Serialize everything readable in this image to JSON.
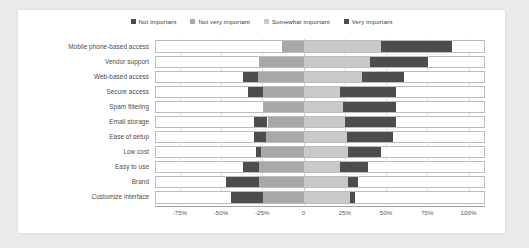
{
  "chart_data": {
    "type": "bar",
    "subtype": "diverging-stacked-likert",
    "title": "",
    "xlabel": "",
    "ylabel": "",
    "orientation": "horizontal",
    "grid": true,
    "legend_position": "top-center",
    "xlim": [
      -90,
      110
    ],
    "xticks": [
      -75,
      -50,
      -25,
      0,
      25,
      50,
      75,
      100
    ],
    "xticklabels": [
      "-75%",
      "-50%",
      "-25%",
      "0",
      "25%",
      "50%",
      "75%",
      "100%"
    ],
    "zero_reference": "boundary between 'Not very important' and 'Somewhat important'",
    "series": [
      {
        "name": "Not important",
        "color": "#4d4d4d",
        "values": [
          0,
          0,
          9,
          9,
          0,
          8,
          7,
          3,
          10,
          20,
          19
        ]
      },
      {
        "name": "Not very important",
        "color": "#a8a8a8",
        "values": [
          13,
          27,
          28,
          25,
          25,
          22,
          23,
          26,
          27,
          27,
          25
        ]
      },
      {
        "name": "Somewhat important",
        "color": "#c9c9c9",
        "values": [
          47,
          40,
          35,
          22,
          24,
          25,
          26,
          27,
          22,
          27,
          28
        ]
      },
      {
        "name": "Very important",
        "color": "#4d4d4d",
        "values": [
          43,
          35,
          26,
          34,
          32,
          31,
          28,
          20,
          17,
          6,
          3
        ]
      }
    ],
    "categories": [
      "Mobile phone-based access",
      "Vendor support",
      "Web-based access",
      "Secure access",
      "Spam filtering",
      "Email storage",
      "Ease of setup",
      "Low cost",
      "Easy to use",
      "Brand",
      "Customize interface"
    ]
  },
  "legend": {
    "items": [
      {
        "label": "Not important",
        "color": "#4d4d4d"
      },
      {
        "label": "Not very important",
        "color": "#a8a8a8"
      },
      {
        "label": "Somewhat important",
        "color": "#c9c9c9"
      },
      {
        "label": "Very important",
        "color": "#4d4d4d"
      }
    ]
  }
}
